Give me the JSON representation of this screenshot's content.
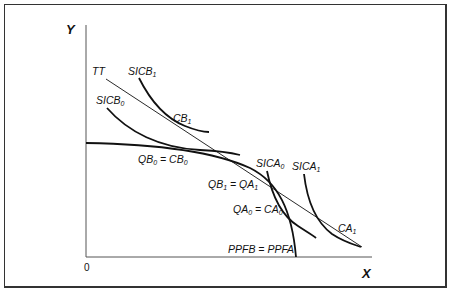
{
  "diagram": {
    "axes": {
      "y_label": "Y",
      "x_label": "X",
      "origin_label": "0"
    },
    "curves": {
      "terms_of_trade": {
        "label": "TT"
      },
      "ppf": {
        "label_main": "PPFB = PPFA"
      },
      "sicb0": {
        "label": "SICB",
        "sub": "0"
      },
      "sicb1": {
        "label": "SICB",
        "sub": "1"
      },
      "sica0": {
        "label": "SICA",
        "sub": "0"
      },
      "sica1": {
        "label": "SICA",
        "sub": "1"
      }
    },
    "points": {
      "cb1": {
        "label": "CB",
        "sub": "1"
      },
      "qb0_cb0": {
        "a": "QB",
        "a_sub": "0",
        "eq": " = ",
        "b": "CB",
        "b_sub": "0"
      },
      "qb1_qa1": {
        "a": "QB",
        "a_sub": "1",
        "eq": " = ",
        "b": "QA",
        "b_sub": "1"
      },
      "qa0_ca0": {
        "a": "QA",
        "a_sub": "0",
        "eq": " = ",
        "b": "CA",
        "b_sub": "0"
      },
      "ca1": {
        "label": "CA",
        "sub": "1"
      }
    },
    "colors": {
      "line": "#111111",
      "frame": "#333333",
      "background": "#ffffff"
    }
  }
}
